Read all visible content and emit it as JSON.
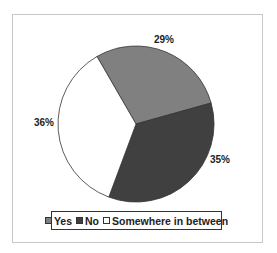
{
  "chart_data": {
    "type": "pie",
    "title": "",
    "categories": [
      "Yes",
      "No",
      "Somewhere in between"
    ],
    "values": [
      29,
      35,
      36
    ],
    "labels": [
      "29%",
      "35%",
      "36%"
    ],
    "colors": [
      "#808080",
      "#404040",
      "#ffffff"
    ],
    "start_angle_deg_clockwise_from_top": 330,
    "legend_position": "bottom"
  },
  "legend": {
    "items": [
      {
        "label": "Yes",
        "color": "#808080"
      },
      {
        "label": "No",
        "color": "#404040"
      },
      {
        "label": "Somewhere in between",
        "color": "#ffffff"
      }
    ]
  },
  "data_labels": {
    "yes": "29%",
    "no": "35%",
    "between": "36%"
  }
}
